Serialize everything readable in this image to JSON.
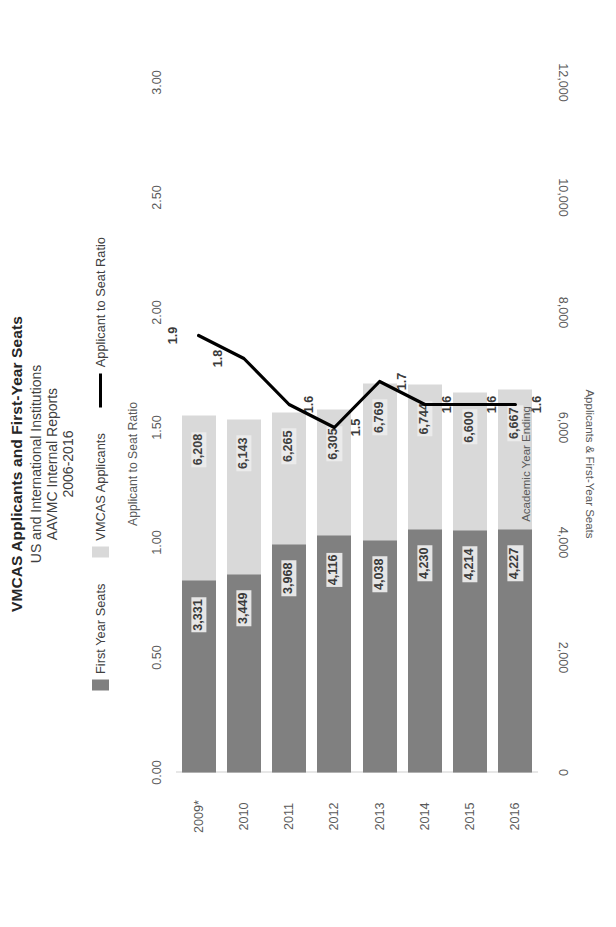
{
  "title": {
    "line1": "VMCAS Applicants and First-Year Seats",
    "line2": "US and International Institutions",
    "line3": "AAVMC Internal Reports",
    "line4": "2006-2016"
  },
  "legend": {
    "items": [
      {
        "label": "First Year Seats",
        "marker": "swatch",
        "color": "#808080"
      },
      {
        "label": "VMCAS Applicants",
        "marker": "swatch",
        "color": "#d9d9d9"
      },
      {
        "label": "Applicant to Seat Ratio",
        "marker": "line",
        "color": "#000000"
      }
    ]
  },
  "axes": {
    "primary_title": "Applicants & First-Year Seats",
    "primary_ticks": [
      "0",
      "2,000",
      "4,000",
      "6,000",
      "8,000",
      "10,000",
      "12,000"
    ],
    "secondary_title": "Applicant to Seat Ratio",
    "secondary_ticks": [
      "0.00",
      "0.50",
      "1.00",
      "1.50",
      "2.00",
      "2.50",
      "3.00"
    ],
    "category_title": "Academic Year Ending"
  },
  "chart_data": {
    "type": "bar",
    "title": "VMCAS Applicants and First-Year Seats",
    "subtitle": "US and International Institutions / AAVMC Internal Reports / 2006-2016",
    "xlabel": "Academic Year Ending",
    "ylabel": "Applicants & First-Year Seats",
    "y2label": "Applicant to Seat Ratio",
    "ylim": [
      0,
      12000
    ],
    "y2lim": [
      0,
      3.0
    ],
    "grid": false,
    "legend_position": "top",
    "orientation": "horizontal-bars",
    "categories": [
      "2009*",
      "2010",
      "2011",
      "2012",
      "2013",
      "2014",
      "2015",
      "2016"
    ],
    "series": [
      {
        "name": "VMCAS Applicants",
        "type": "bar",
        "color": "#d9d9d9",
        "axis": "primary",
        "values": [
          6208,
          6143,
          6265,
          6305,
          6769,
          6744,
          6600,
          6667
        ],
        "labels": [
          "6,208",
          "6,143",
          "6,265",
          "6,305",
          "6,769",
          "6,744",
          "6,600",
          "6,667"
        ]
      },
      {
        "name": "First Year Seats",
        "type": "bar",
        "color": "#808080",
        "axis": "primary",
        "values": [
          3331,
          3449,
          3968,
          4116,
          4038,
          4230,
          4214,
          4227
        ],
        "labels": [
          "3,331",
          "3,449",
          "3,968",
          "4,116",
          "4,038",
          "4,230",
          "4,214",
          "4,227"
        ]
      },
      {
        "name": "Applicant to Seat Ratio",
        "type": "line",
        "color": "#000000",
        "axis": "secondary",
        "values": [
          1.9,
          1.8,
          1.6,
          1.5,
          1.7,
          1.6,
          1.6,
          1.6
        ],
        "labels": [
          "1.9",
          "1.8",
          "1.6",
          "1.5",
          "1.7",
          "1.6",
          "1.6",
          "1.6"
        ]
      }
    ]
  }
}
